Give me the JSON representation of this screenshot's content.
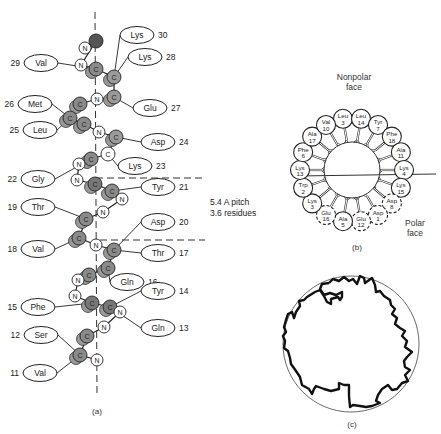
{
  "panel_a": {
    "caption": "(a)",
    "pitch_note": [
      "5.4 A pitch",
      "3.6 residues"
    ],
    "residues": [
      {
        "name": "Lys",
        "num": "30",
        "side": "right",
        "x": 137,
        "y": 35
      },
      {
        "name": "Val",
        "num": "29",
        "side": "left",
        "x": 41,
        "y": 63
      },
      {
        "name": "Lys",
        "num": "28",
        "side": "right",
        "x": 145,
        "y": 57
      },
      {
        "name": "Met",
        "num": "26",
        "side": "left",
        "x": 35,
        "y": 104
      },
      {
        "name": "Glu",
        "num": "27",
        "side": "right",
        "x": 150,
        "y": 108
      },
      {
        "name": "Leu",
        "num": "25",
        "side": "left",
        "x": 40,
        "y": 130
      },
      {
        "name": "Asp",
        "num": "24",
        "side": "right",
        "x": 158,
        "y": 142
      },
      {
        "name": "Lys",
        "num": "23",
        "side": "right",
        "x": 135,
        "y": 166
      },
      {
        "name": "Gly",
        "num": "22",
        "side": "left",
        "x": 38,
        "y": 179
      },
      {
        "name": "Tyr",
        "num": "21",
        "side": "right",
        "x": 158,
        "y": 187
      },
      {
        "name": "Thr",
        "num": "19",
        "side": "left",
        "x": 38,
        "y": 207
      },
      {
        "name": "Asp",
        "num": "20",
        "side": "right",
        "x": 158,
        "y": 222
      },
      {
        "name": "Val",
        "num": "18",
        "side": "left",
        "x": 38,
        "y": 249
      },
      {
        "name": "Thr",
        "num": "17",
        "side": "right",
        "x": 158,
        "y": 253
      },
      {
        "name": "Gln",
        "num": "16",
        "side": "right",
        "x": 127,
        "y": 282
      },
      {
        "name": "Tyr",
        "num": "14",
        "side": "right",
        "x": 158,
        "y": 291
      },
      {
        "name": "Phe",
        "num": "15",
        "side": "left",
        "x": 38,
        "y": 307
      },
      {
        "name": "Ser",
        "num": "12",
        "side": "left",
        "x": 41,
        "y": 335
      },
      {
        "name": "Gln",
        "num": "13",
        "side": "right",
        "x": 158,
        "y": 328
      },
      {
        "name": "Val",
        "num": "11",
        "side": "left",
        "x": 40,
        "y": 373
      }
    ],
    "atoms": [
      {
        "t": "N",
        "x": 85,
        "y": 48,
        "fill": "#ffffff"
      },
      {
        "t": "",
        "x": 96,
        "y": 41,
        "fill": "#555555"
      },
      {
        "t": "N",
        "x": 81,
        "y": 65,
        "fill": "#ffffff"
      },
      {
        "t": "C",
        "x": 96,
        "y": 69,
        "fill": "#8a8a8a"
      },
      {
        "t": "C",
        "x": 114,
        "y": 77,
        "fill": "#9a9a9a"
      },
      {
        "t": "C",
        "x": 114,
        "y": 97,
        "fill": "#9a9a9a"
      },
      {
        "t": "N",
        "x": 97,
        "y": 99,
        "fill": "#ffffff"
      },
      {
        "t": "C",
        "x": 80,
        "y": 104,
        "fill": "#8a8a8a"
      },
      {
        "t": "C",
        "x": 70,
        "y": 118,
        "fill": "#8a8a8a"
      },
      {
        "t": "C",
        "x": 84,
        "y": 124,
        "fill": "#8a8a8a"
      },
      {
        "t": "N",
        "x": 99,
        "y": 132,
        "fill": "#ffffff"
      },
      {
        "t": "C",
        "x": 116,
        "y": 137,
        "fill": "#9a9a9a"
      },
      {
        "t": "C",
        "x": 108,
        "y": 154,
        "fill": "#ffffff"
      },
      {
        "t": "C",
        "x": 91,
        "y": 159,
        "fill": "#8a8a8a"
      },
      {
        "t": "N",
        "x": 79,
        "y": 164,
        "fill": "#ffffff"
      },
      {
        "t": "N",
        "x": 77,
        "y": 180,
        "fill": "#ffffff"
      },
      {
        "t": "C",
        "x": 95,
        "y": 184,
        "fill": "#777777"
      },
      {
        "t": "C",
        "x": 112,
        "y": 191,
        "fill": "#8a8a8a"
      },
      {
        "t": "N",
        "x": 122,
        "y": 199,
        "fill": "#ffffff"
      },
      {
        "t": "N",
        "x": 103,
        "y": 212,
        "fill": "#ffffff"
      },
      {
        "t": "C",
        "x": 86,
        "y": 219,
        "fill": "#8a8a8a"
      },
      {
        "t": "C",
        "x": 79,
        "y": 238,
        "fill": "#8a8a8a"
      },
      {
        "t": "N",
        "x": 96,
        "y": 245,
        "fill": "#ffffff"
      },
      {
        "t": "C",
        "x": 114,
        "y": 250,
        "fill": "#8a8a8a"
      },
      {
        "t": "C",
        "x": 108,
        "y": 268,
        "fill": "#8a8a8a"
      },
      {
        "t": "C",
        "x": 89,
        "y": 275,
        "fill": "#8a8a8a"
      },
      {
        "t": "N",
        "x": 78,
        "y": 280,
        "fill": "#ffffff"
      },
      {
        "t": "N",
        "x": 75,
        "y": 296,
        "fill": "#ffffff"
      },
      {
        "t": "C",
        "x": 92,
        "y": 303,
        "fill": "#777777"
      },
      {
        "t": "C",
        "x": 110,
        "y": 307,
        "fill": "#777777"
      },
      {
        "t": "N",
        "x": 120,
        "y": 312,
        "fill": "#ffffff"
      },
      {
        "t": "N",
        "x": 104,
        "y": 327,
        "fill": "#ffffff"
      },
      {
        "t": "C",
        "x": 87,
        "y": 336,
        "fill": "#8a8a8a"
      },
      {
        "t": "C",
        "x": 80,
        "y": 355,
        "fill": "#8a8a8a"
      },
      {
        "t": "N",
        "x": 97,
        "y": 360,
        "fill": "#ffffff"
      }
    ]
  },
  "panel_b": {
    "caption": "(b)",
    "top_label": [
      "Nonpolar",
      "face"
    ],
    "bottom_label": [
      "Polar",
      "face"
    ],
    "wheel": [
      {
        "name": "Leu",
        "num": "3",
        "angle": -100,
        "dashed": false
      },
      {
        "name": "Leu",
        "num": "14",
        "angle": -80,
        "dashed": false
      },
      {
        "name": "Tyr",
        "num": "7",
        "angle": -60,
        "dashed": false
      },
      {
        "name": "Phe",
        "num": "18",
        "angle": -40,
        "dashed": false
      },
      {
        "name": "Ala",
        "num": "11",
        "angle": -20,
        "dashed": false
      },
      {
        "name": "Lys",
        "num": "4",
        "angle": 0,
        "dashed": false
      },
      {
        "name": "Lys",
        "num": "15",
        "angle": 20,
        "dashed": false
      },
      {
        "name": "Asp",
        "num": "8",
        "angle": 40,
        "dashed": true
      },
      {
        "name": "Asp",
        "num": "1",
        "angle": 60,
        "dashed": true
      },
      {
        "name": "Glu",
        "num": "12",
        "angle": 80,
        "dashed": true
      },
      {
        "name": "Ala",
        "num": "5",
        "angle": 100,
        "dashed": false
      },
      {
        "name": "Glu",
        "num": "16",
        "angle": 120,
        "dashed": true
      },
      {
        "name": "Lys",
        "num": "3",
        "angle": 140,
        "dashed": false
      },
      {
        "name": "Trp",
        "num": "2",
        "angle": 160,
        "dashed": false
      },
      {
        "name": "Lys",
        "num": "13",
        "angle": 180,
        "dashed": false
      },
      {
        "name": "Phe",
        "num": "6",
        "angle": 200,
        "dashed": false
      },
      {
        "name": "Ala",
        "num": "17",
        "angle": 220,
        "dashed": false
      },
      {
        "name": "Val",
        "num": "10",
        "angle": 240,
        "dashed": false
      }
    ]
  },
  "panel_c": {
    "caption": "(c)"
  }
}
